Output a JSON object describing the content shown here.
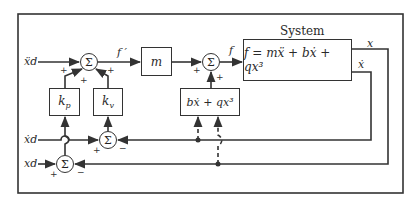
{
  "diagram": {
    "title": "System",
    "system_equation": "f = mẍ + bẋ + qx³",
    "inputs": {
      "accel_desired": "ẍd",
      "vel_desired": "ẋd",
      "pos_desired": "xd"
    },
    "outputs": {
      "position": "x",
      "velocity": "ẋ"
    },
    "signals": {
      "f_prime": "f ′",
      "f": "f"
    },
    "blocks": {
      "kp": "kp",
      "kv": "kv",
      "mass": "m",
      "nonlinear": "bẋ + qx³"
    },
    "summing_symbol": "Σ",
    "signs": {
      "plus": "+",
      "minus": "−"
    },
    "colors": {
      "line": "#333333",
      "background": "#ffffff"
    }
  }
}
